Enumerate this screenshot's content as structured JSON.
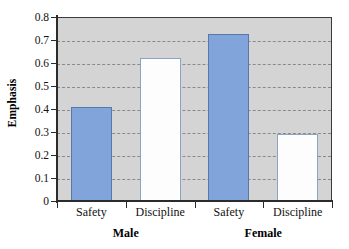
{
  "chart_data": {
    "type": "bar",
    "title": "",
    "xlabel": "",
    "ylabel": "Emphasis",
    "ylim": [
      0,
      0.8
    ],
    "ytick_labels": [
      "0.8",
      "0.7",
      "0.6",
      "0.5",
      "0.4",
      "0.3",
      "0.2",
      "0.1",
      "0"
    ],
    "ytick_values": [
      0.8,
      0.7,
      0.6,
      0.5,
      0.4,
      0.3,
      0.2,
      0.1,
      0
    ],
    "grid": true,
    "legend": "none",
    "categories": [
      "Safety",
      "Discipline",
      "Safety",
      "Discipline"
    ],
    "groups": [
      {
        "label": "Male",
        "categories": [
          "Safety",
          "Discipline"
        ],
        "values": [
          0.41,
          0.62
        ]
      },
      {
        "label": "Female",
        "categories": [
          "Safety",
          "Discipline"
        ],
        "values": [
          0.725,
          0.29
        ]
      }
    ],
    "values": [
      0.41,
      0.62,
      0.725,
      0.29
    ],
    "bar_styles": [
      "filled",
      "hollow",
      "filled",
      "hollow"
    ],
    "colors": {
      "bar_fill": "#81a5da",
      "bar_fill_border": "#5878ad",
      "bar_hollow": "#fdfdfd",
      "bar_hollow_border": "#8ba4c6",
      "plot_background": "#d4d4d4",
      "axis": "#2b2b2b",
      "gridline": "#8a8a8a"
    }
  },
  "axis": {
    "y_title": "Emphasis"
  },
  "category_labels": [
    "Safety",
    "Discipline",
    "Safety",
    "Discipline"
  ],
  "group_labels": [
    "Male",
    "Female"
  ]
}
